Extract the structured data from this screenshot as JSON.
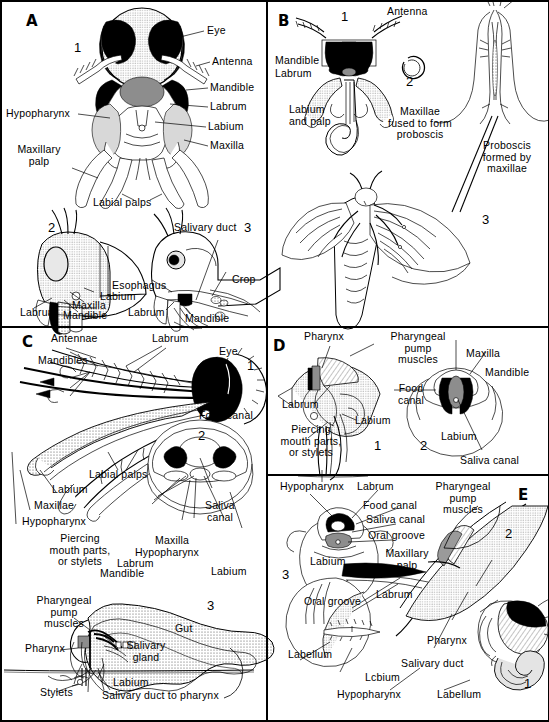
{
  "figure": {
    "panels": [
      {
        "letter": "A",
        "name": "chewing-mouthparts-grasshopper",
        "subfigures": [
          "1",
          "2",
          "3"
        ],
        "labels": [
          "Eye",
          "Antenna",
          "Mandible",
          "Labrum",
          "Labium",
          "Maxilla",
          "Hypopharynx",
          "Maxillary palp",
          "Labial palps",
          "Salivary duct",
          "Esophagus",
          "Crop",
          "Labrum",
          "Labium",
          "Maxilla",
          "Mandible",
          "Labrum",
          "Mandible"
        ]
      },
      {
        "letter": "B",
        "name": "siphoning-mouthparts-moth",
        "subfigures": [
          "1",
          "2",
          "3"
        ],
        "labels": [
          "Antenna",
          "Mandible",
          "Labrum",
          "Labium and palp",
          "Maxillae fused to form proboscis",
          "Proboscis formed by maxillae"
        ]
      },
      {
        "letter": "C",
        "name": "piercing-sucking-mouthparts-mosquito",
        "subfigures": [
          "1",
          "2",
          "3"
        ],
        "labels": [
          "Antennae",
          "Labrum",
          "Eye",
          "Mandibles",
          "Labial palps",
          "Labium",
          "Maxillae",
          "Hypopharynx",
          "Piercing mouth parts, or stylets",
          "Food canal",
          "Saliva canal",
          "Maxilla",
          "Hypopharynx",
          "Labrum",
          "Mandible",
          "Labium",
          "Pharyngeal pump muscles",
          "Pharynx",
          "Salivary gland",
          "Gut",
          "Stylets",
          "Labium",
          "Salivary duct to pharynx"
        ]
      },
      {
        "letter": "D",
        "name": "piercing-sucking-mouthparts-bug",
        "subfigures": [
          "1",
          "2"
        ],
        "labels": [
          "Pharynx",
          "Pharyngeal pump muscles",
          "Labrum",
          "Labium",
          "Piercing mouth parts, or stylets",
          "Maxilla",
          "Mandible",
          "Food canal",
          "Labium",
          "Saliva canal"
        ]
      },
      {
        "letter": "E",
        "name": "sponging-mouthparts-housefly",
        "subfigures": [
          "1",
          "2",
          "3"
        ],
        "labels": [
          "Hypopharynx",
          "Labrum",
          "Food canal",
          "Saliva canal",
          "Oral groove",
          "Labium",
          "Oral groove",
          "Maxillary palp",
          "Labrum",
          "Pharyngeal pump muscles",
          "Labellum",
          "Labium",
          "Hypopharynx",
          "Pharynx",
          "Salivary duct",
          "Labellum"
        ]
      }
    ]
  },
  "A": {
    "letter": "A",
    "n1": "1",
    "n2": "2",
    "n3": "3",
    "eye": "Eye",
    "antenna": "Antenna",
    "mandible": "Mandible",
    "labrum": "Labrum",
    "labium": "Labium",
    "maxilla": "Maxilla",
    "hypopharynx": "Hypopharynx",
    "maxillary_palp_l1": "Maxillary",
    "maxillary_palp_l2": "palp",
    "labial_palps": "Labial palps",
    "salivary_duct": "Salivary duct",
    "esophagus": "Esophagus",
    "crop": "Crop",
    "f2_labrum": "Labrum",
    "f2_labium": "Labium",
    "f2_maxilla": "Maxilla",
    "f2_mandible": "Mandible",
    "f3_labrum": "Labrum",
    "f3_mandible": "Mandible"
  },
  "B": {
    "letter": "B",
    "n1": "1",
    "n2": "2",
    "n3": "3",
    "antenna": "Antenna",
    "mandible": "Mandible",
    "labrum": "Labrum",
    "labium_l1": "Labium",
    "labium_l2": "and palp",
    "maxillae_l1": "Maxillae",
    "maxillae_l2": "fused to form",
    "maxillae_l3": "proboscis",
    "proboscis_l1": "Proboscis",
    "proboscis_l2": "formed by",
    "proboscis_l3": "maxillae"
  },
  "C": {
    "letter": "C",
    "n1": "1",
    "n2": "2",
    "n3": "3",
    "antennae": "Antennae",
    "labrum": "Labrum",
    "eye": "Eye",
    "mandibles": "Mandibles",
    "labial_palps": "Labial palps",
    "labium": "Labium",
    "maxillae": "Maxillae",
    "hypopharynx": "Hypopharynx",
    "piercing_l1": "Piercing",
    "piercing_l2": "mouth parts,",
    "piercing_l3": "or stylets",
    "food_canal": "Food canal",
    "saliva_l1": "Saliva",
    "saliva_l2": "canal",
    "f2_maxilla": "Maxilla",
    "f2_hypopharynx": "Hypopharynx",
    "f2_labrum": "Labrum",
    "f2_mandible": "Mandible",
    "f2_labium": "Labium",
    "pharyngeal_l1": "Pharyngeal",
    "pharyngeal_l2": "pump",
    "pharyngeal_l3": "muscles",
    "pharynx": "Pharynx",
    "salivary_gland_l1": "Salivary",
    "salivary_gland_l2": "gland",
    "gut": "Gut",
    "stylets": "Stylets",
    "f3_labium": "Labium",
    "salivary_duct_to_pharynx": "Salivary duct to pharynx"
  },
  "D": {
    "letter": "D",
    "n1": "1",
    "n2": "2",
    "pharynx": "Pharynx",
    "pharyngeal_l1": "Pharyngeal",
    "pharyngeal_l2": "pump",
    "pharyngeal_l3": "muscles",
    "labrum": "Labrum",
    "labium": "Labium",
    "piercing_l1": "Piercing",
    "piercing_l2": "mouth parts,",
    "piercing_l3": "or stylets",
    "maxilla": "Maxilla",
    "mandible": "Mandible",
    "food_l1": "Food",
    "food_l2": "canal",
    "f2_labium": "Labium",
    "saliva_canal": "Saliva canal"
  },
  "E": {
    "letter": "E",
    "n1": "1",
    "n2": "2",
    "n3": "3",
    "hypopharynx": "Hypopharynx",
    "labrum": "Labrum",
    "food_canal": "Food canal",
    "saliva_canal": "Saliva canal",
    "oral_groove": "Oral groove",
    "labium": "Labium",
    "oral_groove2": "Oral groove",
    "maxillary_l1": "Maxillary",
    "maxillary_l2": "palp",
    "labrum2": "Labrum",
    "pharyngeal_l1": "Pharyngeal",
    "pharyngeal_l2": "pump",
    "pharyngeal_l3": "muscles",
    "labellum": "Labellum",
    "labium2": "Lcbium",
    "hypopharynx2": "Hypopharynx",
    "pharynx": "Pharynx",
    "salivary_duct": "Salivary duct",
    "labellum2": "Labellum"
  },
  "colors": {
    "ink": "#000000",
    "paper": "#ffffff",
    "gray_fill": "#8d8d8d",
    "light_fill": "#d8d8d8",
    "stipple": "#c9c9c9"
  }
}
